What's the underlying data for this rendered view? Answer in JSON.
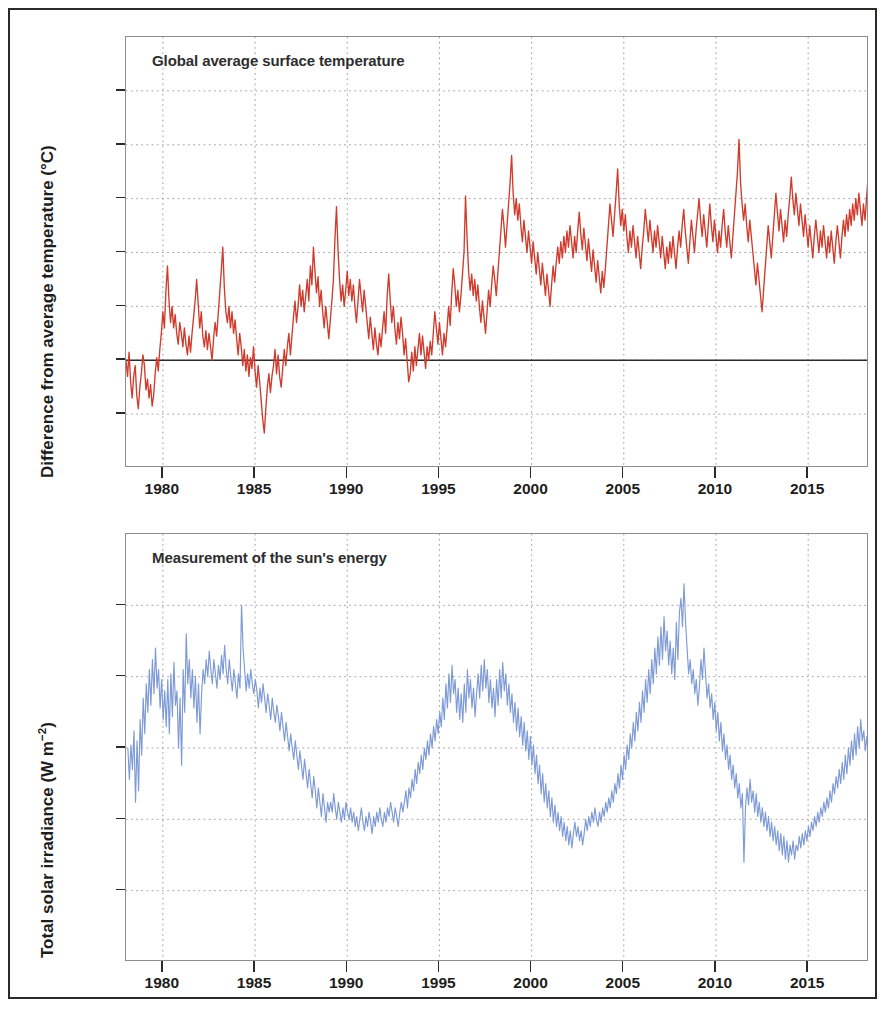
{
  "figure": {
    "background": "#ffffff",
    "frame_color": "#2b2a29"
  },
  "chart_data": [
    {
      "type": "line",
      "panel": "top",
      "title": "Global average surface temperature",
      "xlabel": "",
      "ylabel": "Difference from average temperature (°C)",
      "ylabel_html": "Difference from average temperature (°C)",
      "series_color": "#cf3b2c",
      "zero_line": 0.0,
      "xlim": [
        1978.0,
        2018.3
      ],
      "ylim": [
        -0.4,
        1.2
      ],
      "xticks": [
        1980,
        1985,
        1990,
        1995,
        2000,
        2005,
        2010,
        2015
      ],
      "xtick_labels": [
        "1980",
        "1985",
        "1990",
        "1995",
        "2000",
        "2005",
        "2010",
        "2015"
      ],
      "yticks": [
        -0.4,
        -0.2,
        0.0,
        0.2,
        0.4,
        0.6,
        0.8,
        1.0,
        1.2
      ],
      "ytick_labels": [
        "-0.4",
        "-0.2",
        "0.0",
        "0.2",
        "0.4",
        "0.6",
        "0.8",
        "1.0",
        "1.2"
      ],
      "grid": true,
      "grid_style": "dotted",
      "legend": "none",
      "x_start": 1978.0,
      "x_step": 0.0833333,
      "units": "°C",
      "values": [
        0.0,
        -0.06,
        0.03,
        -0.08,
        -0.14,
        -0.06,
        -0.02,
        -0.13,
        -0.18,
        -0.1,
        -0.05,
        0.02,
        -0.02,
        -0.11,
        -0.07,
        -0.14,
        -0.09,
        -0.17,
        -0.13,
        -0.05,
        0.01,
        -0.04,
        0.04,
        0.1,
        0.18,
        0.12,
        0.26,
        0.35,
        0.22,
        0.14,
        0.2,
        0.12,
        0.17,
        0.1,
        0.06,
        0.14,
        0.1,
        0.05,
        0.12,
        0.06,
        0.02,
        0.09,
        0.03,
        0.1,
        0.16,
        0.22,
        0.3,
        0.21,
        0.12,
        0.18,
        0.09,
        0.05,
        0.11,
        0.04,
        0.1,
        0.05,
        0.0,
        0.08,
        0.14,
        0.09,
        0.17,
        0.25,
        0.33,
        0.42,
        0.27,
        0.18,
        0.14,
        0.2,
        0.12,
        0.18,
        0.1,
        0.15,
        0.08,
        0.02,
        0.1,
        0.05,
        -0.02,
        0.04,
        -0.04,
        0.02,
        -0.06,
        0.01,
        -0.03,
        0.05,
        -0.04,
        -0.1,
        -0.02,
        -0.08,
        -0.15,
        -0.22,
        -0.27,
        -0.18,
        -0.1,
        -0.05,
        -0.12,
        -0.06,
        -0.02,
        0.04,
        -0.05,
        0.02,
        -0.06,
        -0.1,
        -0.03,
        0.04,
        -0.02,
        0.05,
        0.1,
        0.02,
        0.09,
        0.16,
        0.22,
        0.14,
        0.2,
        0.28,
        0.2,
        0.26,
        0.18,
        0.24,
        0.3,
        0.22,
        0.35,
        0.28,
        0.42,
        0.33,
        0.25,
        0.31,
        0.2,
        0.26,
        0.18,
        0.12,
        0.2,
        0.14,
        0.08,
        0.15,
        0.22,
        0.3,
        0.45,
        0.57,
        0.41,
        0.3,
        0.22,
        0.28,
        0.2,
        0.26,
        0.33,
        0.24,
        0.3,
        0.22,
        0.28,
        0.2,
        0.14,
        0.22,
        0.3,
        0.24,
        0.18,
        0.26,
        0.2,
        0.14,
        0.08,
        0.16,
        0.1,
        0.04,
        0.12,
        0.06,
        0.02,
        0.1,
        0.05,
        0.12,
        0.18,
        0.1,
        0.24,
        0.32,
        0.22,
        0.14,
        0.2,
        0.12,
        0.06,
        0.14,
        0.08,
        0.16,
        0.1,
        0.02,
        0.08,
        0.0,
        -0.08,
        -0.05,
        0.03,
        -0.04,
        0.05,
        -0.02,
        0.04,
        0.1,
        0.02,
        0.09,
        0.03,
        -0.03,
        0.05,
        0.0,
        0.07,
        0.02,
        0.1,
        0.18,
        0.12,
        0.06,
        0.14,
        0.08,
        0.02,
        0.1,
        0.05,
        0.12,
        0.2,
        0.13,
        0.25,
        0.34,
        0.28,
        0.2,
        0.26,
        0.18,
        0.24,
        0.32,
        0.4,
        0.61,
        0.45,
        0.33,
        0.26,
        0.32,
        0.24,
        0.3,
        0.22,
        0.28,
        0.2,
        0.14,
        0.22,
        0.16,
        0.1,
        0.18,
        0.26,
        0.2,
        0.28,
        0.35,
        0.3,
        0.24,
        0.32,
        0.4,
        0.48,
        0.56,
        0.5,
        0.42,
        0.5,
        0.58,
        0.66,
        0.76,
        0.62,
        0.54,
        0.6,
        0.52,
        0.58,
        0.5,
        0.44,
        0.52,
        0.46,
        0.4,
        0.48,
        0.42,
        0.36,
        0.44,
        0.38,
        0.32,
        0.4,
        0.34,
        0.28,
        0.36,
        0.3,
        0.24,
        0.32,
        0.26,
        0.2,
        0.28,
        0.35,
        0.29,
        0.36,
        0.42,
        0.36,
        0.44,
        0.38,
        0.46,
        0.4,
        0.48,
        0.42,
        0.5,
        0.44,
        0.38,
        0.46,
        0.4,
        0.48,
        0.55,
        0.47,
        0.41,
        0.49,
        0.43,
        0.37,
        0.45,
        0.39,
        0.33,
        0.41,
        0.35,
        0.29,
        0.37,
        0.31,
        0.25,
        0.33,
        0.27,
        0.34,
        0.42,
        0.5,
        0.58,
        0.52,
        0.46,
        0.54,
        0.62,
        0.71,
        0.58,
        0.5,
        0.56,
        0.48,
        0.54,
        0.46,
        0.4,
        0.48,
        0.42,
        0.5,
        0.44,
        0.38,
        0.46,
        0.4,
        0.34,
        0.42,
        0.48,
        0.56,
        0.5,
        0.44,
        0.52,
        0.46,
        0.4,
        0.48,
        0.42,
        0.5,
        0.44,
        0.38,
        0.46,
        0.4,
        0.34,
        0.42,
        0.36,
        0.44,
        0.38,
        0.46,
        0.4,
        0.34,
        0.42,
        0.48,
        0.42,
        0.5,
        0.56,
        0.48,
        0.42,
        0.36,
        0.44,
        0.52,
        0.46,
        0.4,
        0.48,
        0.54,
        0.6,
        0.52,
        0.46,
        0.54,
        0.48,
        0.42,
        0.5,
        0.58,
        0.5,
        0.44,
        0.52,
        0.46,
        0.4,
        0.48,
        0.42,
        0.5,
        0.56,
        0.48,
        0.42,
        0.5,
        0.44,
        0.38,
        0.46,
        0.54,
        0.62,
        0.7,
        0.82,
        0.66,
        0.58,
        0.52,
        0.58,
        0.5,
        0.44,
        0.52,
        0.46,
        0.4,
        0.34,
        0.28,
        0.36,
        0.3,
        0.24,
        0.18,
        0.26,
        0.34,
        0.42,
        0.5,
        0.44,
        0.38,
        0.46,
        0.54,
        0.62,
        0.55,
        0.48,
        0.56,
        0.5,
        0.44,
        0.52,
        0.46,
        0.54,
        0.6,
        0.68,
        0.6,
        0.54,
        0.62,
        0.56,
        0.5,
        0.58,
        0.52,
        0.46,
        0.54,
        0.48,
        0.42,
        0.5,
        0.44,
        0.38,
        0.46,
        0.52,
        0.46,
        0.4,
        0.48,
        0.42,
        0.5,
        0.44,
        0.38,
        0.46,
        0.4,
        0.48,
        0.42,
        0.36,
        0.44,
        0.5,
        0.44,
        0.38,
        0.46,
        0.52,
        0.46,
        0.54,
        0.48,
        0.56,
        0.5,
        0.58,
        0.52,
        0.6,
        0.54,
        0.62,
        0.56,
        0.5,
        0.58,
        0.52,
        0.6,
        0.68,
        0.62,
        0.56,
        0.64,
        0.58,
        0.66,
        0.6,
        0.68,
        0.76,
        0.7,
        0.64,
        0.72,
        0.66,
        0.74,
        0.68,
        0.76,
        0.7,
        0.78,
        0.86,
        0.94,
        1.02,
        1.12,
        1.04,
        0.92,
        0.84,
        0.76,
        0.7,
        0.78,
        0.72,
        0.8,
        0.74,
        0.82,
        0.76,
        0.7,
        0.64,
        0.72,
        0.66,
        0.6,
        0.68,
        0.62,
        0.56,
        0.64,
        0.58,
        0.52,
        0.6
      ]
    },
    {
      "type": "line",
      "panel": "bottom",
      "title": "Measurement of the sun's energy",
      "xlabel": "",
      "ylabel": "Total solar irradiance (W m−2)",
      "series_color": "#7e9ad6",
      "xlim": [
        1978.0,
        2018.3
      ],
      "ylim": [
        1359.5,
        1362.5
      ],
      "xticks": [
        1980,
        1985,
        1990,
        1995,
        2000,
        2005,
        2010,
        2015
      ],
      "xtick_labels": [
        "1980",
        "1985",
        "1990",
        "1995",
        "2000",
        "2005",
        "2010",
        "2015"
      ],
      "yticks": [
        1359.5,
        1360.0,
        1360.5,
        1361.0,
        1361.5,
        1362.0,
        1362.5
      ],
      "ytick_labels": [
        "1359.5",
        "1360.0",
        "1360.5",
        "1361.0",
        "1361.5",
        "1362.0",
        "1362.5"
      ],
      "grid": true,
      "grid_style": "dotted",
      "legend": "none",
      "x_start": 1978.1,
      "x_step": 0.0833333,
      "units": "W m-2",
      "values": [
        1361.0,
        1360.78,
        1361.02,
        1360.85,
        1361.12,
        1360.62,
        1361.05,
        1360.7,
        1361.2,
        1360.95,
        1361.35,
        1361.1,
        1361.45,
        1361.25,
        1361.55,
        1361.3,
        1361.62,
        1361.38,
        1361.7,
        1361.42,
        1361.55,
        1361.28,
        1361.48,
        1361.2,
        1361.4,
        1361.15,
        1361.48,
        1361.1,
        1361.52,
        1361.22,
        1361.6,
        1361.3,
        1361.4,
        1361.0,
        1361.35,
        1360.88,
        1361.55,
        1361.25,
        1361.8,
        1361.45,
        1361.62,
        1361.35,
        1361.55,
        1361.28,
        1361.5,
        1361.18,
        1361.45,
        1361.1,
        1361.38,
        1361.55,
        1361.45,
        1361.62,
        1361.5,
        1361.68,
        1361.55,
        1361.45,
        1361.62,
        1361.52,
        1361.42,
        1361.58,
        1361.48,
        1361.65,
        1361.52,
        1361.72,
        1361.55,
        1361.45,
        1361.62,
        1361.5,
        1361.4,
        1361.55,
        1361.45,
        1361.35,
        1361.52,
        1361.42,
        1362.0,
        1361.7,
        1361.55,
        1361.4,
        1361.52,
        1361.42,
        1361.55,
        1361.45,
        1361.38,
        1361.48,
        1361.4,
        1361.28,
        1361.42,
        1361.32,
        1361.45,
        1361.35,
        1361.25,
        1361.38,
        1361.3,
        1361.2,
        1361.35,
        1361.25,
        1361.18,
        1361.3,
        1361.22,
        1361.12,
        1361.25,
        1361.15,
        1361.05,
        1361.18,
        1361.08,
        1360.98,
        1361.1,
        1361.0,
        1360.92,
        1361.05,
        1360.95,
        1360.85,
        1360.98,
        1360.88,
        1360.78,
        1360.92,
        1360.82,
        1360.72,
        1360.85,
        1360.75,
        1360.65,
        1360.8,
        1360.7,
        1360.58,
        1360.72,
        1360.62,
        1360.52,
        1360.68,
        1360.58,
        1360.48,
        1360.62,
        1360.55,
        1360.62,
        1360.55,
        1360.68,
        1360.58,
        1360.5,
        1360.62,
        1360.55,
        1360.48,
        1360.58,
        1360.5,
        1360.62,
        1360.55,
        1360.5,
        1360.58,
        1360.48,
        1360.55,
        1360.45,
        1360.52,
        1360.42,
        1360.5,
        1360.58,
        1360.48,
        1360.42,
        1360.52,
        1360.45,
        1360.55,
        1360.48,
        1360.4,
        1360.52,
        1360.45,
        1360.55,
        1360.48,
        1360.58,
        1360.5,
        1360.45,
        1360.55,
        1360.48,
        1360.58,
        1360.52,
        1360.62,
        1360.55,
        1360.48,
        1360.58,
        1360.52,
        1360.45,
        1360.55,
        1360.62,
        1360.55,
        1360.62,
        1360.7,
        1360.58,
        1360.72,
        1360.65,
        1360.78,
        1360.7,
        1360.85,
        1360.75,
        1360.9,
        1360.82,
        1360.95,
        1360.85,
        1361.0,
        1360.92,
        1361.05,
        1360.95,
        1361.1,
        1361.0,
        1361.15,
        1361.05,
        1361.2,
        1361.1,
        1361.25,
        1361.15,
        1361.35,
        1361.2,
        1361.45,
        1361.28,
        1361.52,
        1361.32,
        1361.58,
        1361.38,
        1361.48,
        1361.25,
        1361.42,
        1361.2,
        1361.38,
        1361.18,
        1361.45,
        1361.25,
        1361.55,
        1361.35,
        1361.48,
        1361.28,
        1361.42,
        1361.22,
        1361.38,
        1361.52,
        1361.35,
        1361.58,
        1361.4,
        1361.62,
        1361.42,
        1361.55,
        1361.32,
        1361.48,
        1361.28,
        1361.42,
        1361.22,
        1361.48,
        1361.3,
        1361.55,
        1361.35,
        1361.6,
        1361.4,
        1361.52,
        1361.3,
        1361.45,
        1361.25,
        1361.38,
        1361.18,
        1361.32,
        1361.12,
        1361.28,
        1361.08,
        1361.22,
        1361.02,
        1361.18,
        1360.98,
        1361.12,
        1360.92,
        1361.08,
        1360.88,
        1361.02,
        1360.82,
        1360.95,
        1360.75,
        1360.88,
        1360.68,
        1360.82,
        1360.62,
        1360.75,
        1360.58,
        1360.7,
        1360.52,
        1360.65,
        1360.48,
        1360.6,
        1360.45,
        1360.55,
        1360.42,
        1360.52,
        1360.38,
        1360.48,
        1360.35,
        1360.45,
        1360.32,
        1360.42,
        1360.3,
        1360.4,
        1360.48,
        1360.38,
        1360.45,
        1360.35,
        1360.42,
        1360.32,
        1360.4,
        1360.5,
        1360.42,
        1360.52,
        1360.45,
        1360.55,
        1360.48,
        1360.58,
        1360.5,
        1360.45,
        1360.55,
        1360.48,
        1360.58,
        1360.52,
        1360.62,
        1360.55,
        1360.65,
        1360.58,
        1360.7,
        1360.62,
        1360.75,
        1360.68,
        1360.82,
        1360.72,
        1360.88,
        1360.78,
        1360.95,
        1360.85,
        1361.02,
        1360.92,
        1361.1,
        1361.0,
        1361.18,
        1361.05,
        1361.25,
        1361.12,
        1361.32,
        1361.18,
        1361.4,
        1361.25,
        1361.48,
        1361.32,
        1361.55,
        1361.38,
        1361.62,
        1361.45,
        1361.7,
        1361.52,
        1361.78,
        1361.58,
        1361.85,
        1361.62,
        1361.92,
        1361.68,
        1361.82,
        1361.58,
        1361.75,
        1361.52,
        1361.7,
        1361.48,
        1361.88,
        1361.62,
        1361.95,
        1362.05,
        1361.85,
        1362.15,
        1361.88,
        1361.7,
        1361.52,
        1361.62,
        1361.45,
        1361.55,
        1361.38,
        1361.48,
        1361.3,
        1361.42,
        1361.62,
        1361.48,
        1361.7,
        1361.52,
        1361.35,
        1361.45,
        1361.28,
        1361.38,
        1361.2,
        1361.32,
        1361.12,
        1361.25,
        1361.05,
        1361.18,
        1360.98,
        1361.1,
        1360.92,
        1361.02,
        1360.85,
        1360.95,
        1360.78,
        1360.88,
        1360.72,
        1360.82,
        1360.65,
        1360.75,
        1360.58,
        1360.68,
        1360.2,
        1360.58,
        1360.72,
        1360.6,
        1360.78,
        1360.62,
        1360.7,
        1360.55,
        1360.68,
        1360.52,
        1360.62,
        1360.48,
        1360.58,
        1360.45,
        1360.55,
        1360.42,
        1360.52,
        1360.38,
        1360.48,
        1360.35,
        1360.45,
        1360.32,
        1360.42,
        1360.28,
        1360.4,
        1360.25,
        1360.38,
        1360.22,
        1360.35,
        1360.2,
        1360.32,
        1360.25,
        1360.35,
        1360.22,
        1360.32,
        1360.28,
        1360.38,
        1360.3,
        1360.4,
        1360.32,
        1360.42,
        1360.35,
        1360.45,
        1360.38,
        1360.48,
        1360.42,
        1360.52,
        1360.45,
        1360.55,
        1360.48,
        1360.58,
        1360.52,
        1360.62,
        1360.55,
        1360.65,
        1360.58,
        1360.7,
        1360.62,
        1360.75,
        1360.68,
        1360.8,
        1360.72,
        1360.85,
        1360.75,
        1360.9,
        1360.78,
        1360.95,
        1360.82,
        1361.0,
        1360.88,
        1361.05,
        1360.92,
        1361.1,
        1360.95,
        1361.15,
        1361.0,
        1361.2,
        1361.05,
        1361.12,
        1360.98,
        1361.08,
        1360.95,
        1361.15,
        1361.02,
        1361.22,
        1361.08,
        1361.3,
        1361.12,
        1361.38,
        1361.18,
        1361.25,
        1361.05,
        1361.15,
        1361.35,
        1361.18,
        1361.42,
        1361.22,
        1361.5,
        1361.28,
        1361.38,
        1361.15,
        1361.28,
        1361.08,
        1361.18,
        1360.98,
        1361.1,
        1360.92,
        1361.02,
        1360.85,
        1360.95,
        1360.75,
        1360.88,
        1360.68,
        1360.8,
        1360.62,
        1360.72,
        1360.55,
        1360.65,
        1360.48,
        1360.58,
        1360.42,
        1360.52,
        1360.35,
        1360.45,
        1360.28,
        1360.1,
        1360.35
      ]
    }
  ]
}
